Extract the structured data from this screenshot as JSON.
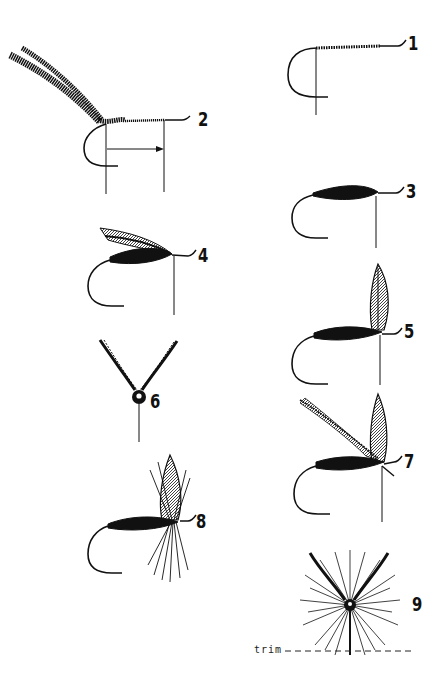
{
  "figure": {
    "ink_color": "#111111",
    "background": "#ffffff"
  },
  "steps": [
    {
      "number": "1",
      "description": "Thread wrapped along hook shank"
    },
    {
      "number": "2",
      "description": "Chenille/hackle tied in at bend, with measurement arrow along shank"
    },
    {
      "number": "3",
      "description": "Body wrapped forward"
    },
    {
      "number": "4",
      "description": "Wing tied in over body"
    },
    {
      "number": "5",
      "description": "Upright wing tied in behind eye"
    },
    {
      "number": "6",
      "description": "Front view of divided wings"
    },
    {
      "number": "7",
      "description": "Wings and hackle tied in"
    },
    {
      "number": "8",
      "description": "Hackle wrapped, finished dry fly"
    },
    {
      "number": "9",
      "description": "Front view of hackled fly with trim line"
    }
  ],
  "annotations": {
    "trim_label": "trim"
  }
}
